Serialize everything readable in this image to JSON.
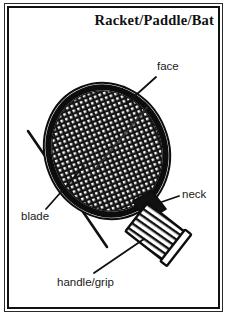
{
  "figure": {
    "title": "Racket/Paddle/Bat",
    "kind": "labeled-line-drawing",
    "background_color": "#ffffff",
    "ink_color": "#111111"
  },
  "labels": {
    "face": "face",
    "neck": "neck",
    "blade": "blade",
    "handle_grip": "handle/grip"
  },
  "parts": [
    {
      "name": "face",
      "label": "face",
      "description": "large oval hitting surface filled with a dark crosshatch mesh pattern",
      "fill": "crosshatch",
      "color": "#1b1b1b"
    },
    {
      "name": "blade",
      "label": "blade",
      "description": "thick oval outline ring forming the frame of the racket head",
      "fill": "solid",
      "color": "#0d0d0d"
    },
    {
      "name": "neck",
      "label": "neck",
      "description": "short tapered throat joining the oval head to the handle",
      "fill": "solid",
      "color": "#0d0d0d"
    },
    {
      "name": "handle/grip",
      "label": "handle/grip",
      "description": "angled rectangular grip wrapped with parallel binding stripes",
      "fill": "striped",
      "color": "#111111"
    }
  ],
  "leader_lines": [
    {
      "name": "face-leader",
      "from_label": "face",
      "points_to": "face"
    },
    {
      "name": "neck-leader",
      "from_label": "neck",
      "points_to": "neck"
    },
    {
      "name": "blade-leader",
      "from_label": "blade",
      "points_to": "blade"
    },
    {
      "name": "grip-leader",
      "from_label": "handle/grip",
      "points_to": "handle/grip"
    }
  ]
}
